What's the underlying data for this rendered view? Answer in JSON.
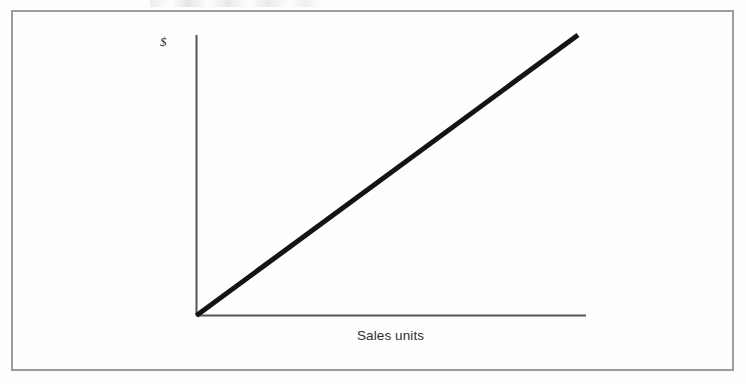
{
  "figure": {
    "frame": {
      "border_color": "#9c9c9c",
      "background_color": "#fefefe"
    },
    "page_background": "#fdfdfd"
  },
  "chart_data": {
    "type": "line",
    "title": "",
    "subtitle": "",
    "xlabel": "Sales units",
    "ylabel": "$",
    "grid": false,
    "legend": null,
    "legend_position": "none",
    "axis_style": {
      "spines": [
        "left",
        "bottom"
      ],
      "ticks": false,
      "tick_labels": false,
      "axis_color": "#555555"
    },
    "xlim": [
      0,
      1
    ],
    "ylim": [
      0,
      1
    ],
    "x_tick_labels": [],
    "y_tick_labels": [],
    "annotations": [],
    "series": [
      {
        "name": "Revenue",
        "color": "#141414",
        "line_width": 5,
        "x": [
          0,
          1
        ],
        "y": [
          0,
          1
        ],
        "description": "Straight line through the origin with constant positive slope: revenue rises in direct proportion to sales units."
      }
    ]
  },
  "labels": {
    "y_axis": "$",
    "x_axis": "Sales units"
  },
  "icons": {
    "currency": "dollar-sign-glyph"
  }
}
